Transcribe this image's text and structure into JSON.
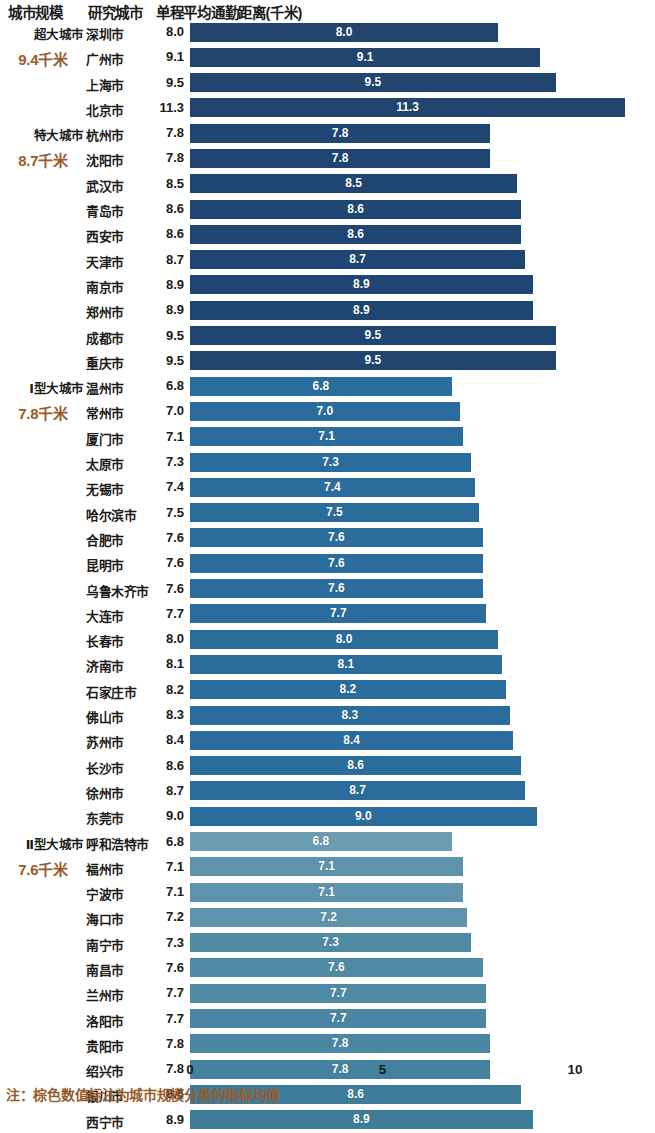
{
  "header": {
    "col_scale": "城市规模",
    "col_city": "研究城市",
    "col_metric": "单程平均通勤距离(千米)"
  },
  "footnote": "注：棕色数值标注为城市规模分类的指标均值",
  "axis": {
    "ticks": [
      "0",
      "5",
      "10"
    ],
    "tick_values": [
      0,
      5,
      10
    ],
    "x0_px": 190,
    "px_per_unit": 38.5
  },
  "colors": {
    "group_mega": "#1f4572",
    "group_super": "#21456f",
    "group_type1": "#2a6d9c",
    "group_type2": "#5e93ab",
    "group_type2_low": "#3d7d99",
    "mean_text": "#9a5b2a",
    "bar_label": "#ffffff"
  },
  "groups": [
    {
      "name": "超大城市",
      "mean": "9.4千米",
      "color": "#21456f"
    },
    {
      "name": "特大城市",
      "mean": "8.7千米",
      "color": "#21456f"
    },
    {
      "name": "Ⅰ型大城市",
      "mean": "7.8千米",
      "color": "#2a6d9c"
    },
    {
      "name": "Ⅱ型大城市",
      "mean": "7.6千米",
      "color": "#5e93ab"
    }
  ],
  "chart_data": {
    "type": "bar",
    "orientation": "horizontal",
    "title": "单程平均通勤距离(千米)",
    "xlabel": "",
    "ylabel": "",
    "xlim": [
      0,
      11.6
    ],
    "grid": false,
    "legend": false,
    "categories": [
      "深圳市",
      "广州市",
      "上海市",
      "北京市",
      "杭州市",
      "沈阳市",
      "武汉市",
      "青岛市",
      "西安市",
      "天津市",
      "南京市",
      "郑州市",
      "成都市",
      "重庆市",
      "温州市",
      "常州市",
      "厦门市",
      "太原市",
      "无锡市",
      "哈尔滨市",
      "合肥市",
      "昆明市",
      "乌鲁木齐市",
      "大连市",
      "长春市",
      "济南市",
      "石家庄市",
      "佛山市",
      "苏州市",
      "长沙市",
      "徐州市",
      "东莞市",
      "呼和浩特市",
      "福州市",
      "宁波市",
      "海口市",
      "南宁市",
      "南昌市",
      "兰州市",
      "洛阳市",
      "贵阳市",
      "绍兴市",
      "银川市",
      "西宁市"
    ],
    "values": [
      8.0,
      9.1,
      9.5,
      11.3,
      7.8,
      7.8,
      8.5,
      8.6,
      8.6,
      8.7,
      8.9,
      8.9,
      9.5,
      9.5,
      6.8,
      7.0,
      7.1,
      7.3,
      7.4,
      7.5,
      7.6,
      7.6,
      7.6,
      7.7,
      8.0,
      8.1,
      8.2,
      8.3,
      8.4,
      8.6,
      8.7,
      9.0,
      6.8,
      7.1,
      7.1,
      7.2,
      7.3,
      7.6,
      7.7,
      7.7,
      7.8,
      7.8,
      8.6,
      8.9
    ]
  },
  "rows": [
    {
      "group_name": "超大城市",
      "group_mean": "",
      "city": "深圳市",
      "value": "8.0",
      "v": 8.0,
      "color": "#21456f"
    },
    {
      "group_name": "",
      "group_mean": "9.4千米",
      "city": "广州市",
      "value": "9.1",
      "v": 9.1,
      "color": "#21456f"
    },
    {
      "group_name": "",
      "group_mean": "",
      "city": "上海市",
      "value": "9.5",
      "v": 9.5,
      "color": "#21456f"
    },
    {
      "group_name": "",
      "group_mean": "",
      "city": "北京市",
      "value": "11.3",
      "v": 11.3,
      "color": "#21456f"
    },
    {
      "group_name": "特大城市",
      "group_mean": "",
      "city": "杭州市",
      "value": "7.8",
      "v": 7.8,
      "color": "#1f4572"
    },
    {
      "group_name": "",
      "group_mean": "8.7千米",
      "city": "沈阳市",
      "value": "7.8",
      "v": 7.8,
      "color": "#1f4572"
    },
    {
      "group_name": "",
      "group_mean": "",
      "city": "武汉市",
      "value": "8.5",
      "v": 8.5,
      "color": "#1f4572"
    },
    {
      "group_name": "",
      "group_mean": "",
      "city": "青岛市",
      "value": "8.6",
      "v": 8.6,
      "color": "#1f4572"
    },
    {
      "group_name": "",
      "group_mean": "",
      "city": "西安市",
      "value": "8.6",
      "v": 8.6,
      "color": "#1f4572"
    },
    {
      "group_name": "",
      "group_mean": "",
      "city": "天津市",
      "value": "8.7",
      "v": 8.7,
      "color": "#1f4572"
    },
    {
      "group_name": "",
      "group_mean": "",
      "city": "南京市",
      "value": "8.9",
      "v": 8.9,
      "color": "#1f4572"
    },
    {
      "group_name": "",
      "group_mean": "",
      "city": "郑州市",
      "value": "8.9",
      "v": 8.9,
      "color": "#1f4572"
    },
    {
      "group_name": "",
      "group_mean": "",
      "city": "成都市",
      "value": "9.5",
      "v": 9.5,
      "color": "#1f4572"
    },
    {
      "group_name": "",
      "group_mean": "",
      "city": "重庆市",
      "value": "9.5",
      "v": 9.5,
      "color": "#21456f"
    },
    {
      "group_name": "Ⅰ型大城市",
      "group_mean": "",
      "city": "温州市",
      "value": "6.8",
      "v": 6.8,
      "color": "#2a6d9c"
    },
    {
      "group_name": "",
      "group_mean": "7.8千米",
      "city": "常州市",
      "value": "7.0",
      "v": 7.0,
      "color": "#2a6d9c"
    },
    {
      "group_name": "",
      "group_mean": "",
      "city": "厦门市",
      "value": "7.1",
      "v": 7.1,
      "color": "#2a6d9c"
    },
    {
      "group_name": "",
      "group_mean": "",
      "city": "太原市",
      "value": "7.3",
      "v": 7.3,
      "color": "#2a6d9c"
    },
    {
      "group_name": "",
      "group_mean": "",
      "city": "无锡市",
      "value": "7.4",
      "v": 7.4,
      "color": "#2a6d9c"
    },
    {
      "group_name": "",
      "group_mean": "",
      "city": "哈尔滨市",
      "value": "7.5",
      "v": 7.5,
      "color": "#2a6d9c"
    },
    {
      "group_name": "",
      "group_mean": "",
      "city": "合肥市",
      "value": "7.6",
      "v": 7.6,
      "color": "#2a6d9c"
    },
    {
      "group_name": "",
      "group_mean": "",
      "city": "昆明市",
      "value": "7.6",
      "v": 7.6,
      "color": "#2a6d9c"
    },
    {
      "group_name": "",
      "group_mean": "",
      "city": "乌鲁木齐市",
      "value": "7.6",
      "v": 7.6,
      "color": "#2a6d9c"
    },
    {
      "group_name": "",
      "group_mean": "",
      "city": "大连市",
      "value": "7.7",
      "v": 7.7,
      "color": "#2a6d9c"
    },
    {
      "group_name": "",
      "group_mean": "",
      "city": "长春市",
      "value": "8.0",
      "v": 8.0,
      "color": "#2a6d9c"
    },
    {
      "group_name": "",
      "group_mean": "",
      "city": "济南市",
      "value": "8.1",
      "v": 8.1,
      "color": "#2a6d9c"
    },
    {
      "group_name": "",
      "group_mean": "",
      "city": "石家庄市",
      "value": "8.2",
      "v": 8.2,
      "color": "#2a6d9c"
    },
    {
      "group_name": "",
      "group_mean": "",
      "city": "佛山市",
      "value": "8.3",
      "v": 8.3,
      "color": "#2a6d9c"
    },
    {
      "group_name": "",
      "group_mean": "",
      "city": "苏州市",
      "value": "8.4",
      "v": 8.4,
      "color": "#2a6d9c"
    },
    {
      "group_name": "",
      "group_mean": "",
      "city": "长沙市",
      "value": "8.6",
      "v": 8.6,
      "color": "#2a6d9c"
    },
    {
      "group_name": "",
      "group_mean": "",
      "city": "徐州市",
      "value": "8.7",
      "v": 8.7,
      "color": "#2a6d9c"
    },
    {
      "group_name": "",
      "group_mean": "",
      "city": "东莞市",
      "value": "9.0",
      "v": 9.0,
      "color": "#2a6d9c"
    },
    {
      "group_name": "Ⅱ型大城市",
      "group_mean": "",
      "city": "呼和浩特市",
      "value": "6.8",
      "v": 6.8,
      "color": "#6a9cb2"
    },
    {
      "group_name": "",
      "group_mean": "7.6千米",
      "city": "福州市",
      "value": "7.1",
      "v": 7.1,
      "color": "#5e93ab"
    },
    {
      "group_name": "",
      "group_mean": "",
      "city": "宁波市",
      "value": "7.1",
      "v": 7.1,
      "color": "#5e93ab"
    },
    {
      "group_name": "",
      "group_mean": "",
      "city": "海口市",
      "value": "7.2",
      "v": 7.2,
      "color": "#5e93ab"
    },
    {
      "group_name": "",
      "group_mean": "",
      "city": "南宁市",
      "value": "7.3",
      "v": 7.3,
      "color": "#4f8aa5"
    },
    {
      "group_name": "",
      "group_mean": "",
      "city": "南昌市",
      "value": "7.6",
      "v": 7.6,
      "color": "#4f8aa5"
    },
    {
      "group_name": "",
      "group_mean": "",
      "city": "兰州市",
      "value": "7.7",
      "v": 7.7,
      "color": "#4f8aa5"
    },
    {
      "group_name": "",
      "group_mean": "",
      "city": "洛阳市",
      "value": "7.7",
      "v": 7.7,
      "color": "#4a86a2"
    },
    {
      "group_name": "",
      "group_mean": "",
      "city": "贵阳市",
      "value": "7.8",
      "v": 7.8,
      "color": "#4a86a2"
    },
    {
      "group_name": "",
      "group_mean": "",
      "city": "绍兴市",
      "value": "7.8",
      "v": 7.8,
      "color": "#44819e"
    },
    {
      "group_name": "",
      "group_mean": "",
      "city": "银川市",
      "value": "8.6",
      "v": 8.6,
      "color": "#3d7d99"
    },
    {
      "group_name": "",
      "group_mean": "",
      "city": "西宁市",
      "value": "8.9",
      "v": 8.9,
      "color": "#3d7d99"
    }
  ]
}
